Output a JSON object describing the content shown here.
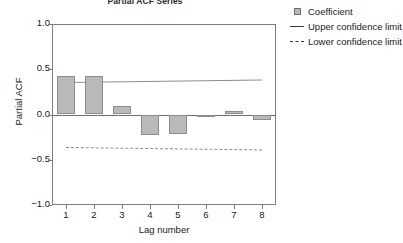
{
  "chart_data": {
    "type": "bar",
    "title": "Partial ACF Series",
    "xlabel": "Lag number",
    "ylabel": "Partial ACF",
    "categories": [
      "1",
      "2",
      "3",
      "4",
      "5",
      "6",
      "7",
      "8"
    ],
    "values": [
      0.42,
      0.43,
      0.09,
      -0.23,
      -0.22,
      -0.01,
      0.04,
      -0.06
    ],
    "series": [
      {
        "name": "Coefficient",
        "values": [
          0.42,
          0.43,
          0.09,
          -0.23,
          -0.22,
          -0.01,
          0.04,
          -0.06
        ]
      }
    ],
    "upper_confidence_limit": [
      0.355,
      0.362,
      0.368,
      0.372,
      0.375,
      0.378,
      0.38,
      0.382
    ],
    "lower_confidence_limit": [
      -0.355,
      -0.362,
      -0.368,
      -0.372,
      -0.375,
      -0.378,
      -0.38,
      -0.382
    ],
    "ylim": [
      -1.0,
      1.0
    ],
    "yticks": [
      "1.0",
      "0.5",
      "0.0",
      "-0.5",
      "-1.0"
    ],
    "ytick_values": [
      1.0,
      0.5,
      0.0,
      -0.5,
      -1.0
    ],
    "xticks": [
      "1",
      "2",
      "3",
      "4",
      "5",
      "6",
      "7",
      "8"
    ],
    "grid": false,
    "legend_position": "top-right",
    "legend": [
      {
        "label": "Coefficient",
        "key": "square-swatch",
        "color": "#b9b9b9"
      },
      {
        "label": "Upper confidence limit",
        "key": "solid-line",
        "color": "#3a3a3a"
      },
      {
        "label": "Lower confidence limit",
        "key": "dashed-line",
        "color": "#3a3a3a"
      }
    ]
  },
  "colors": {
    "bar_fill": "#b9b9b9",
    "bar_stroke": "#8c8c8c",
    "axis": "#7d7d7d",
    "text": "#1a1a1a",
    "reference_line": "#8d8d8d"
  }
}
